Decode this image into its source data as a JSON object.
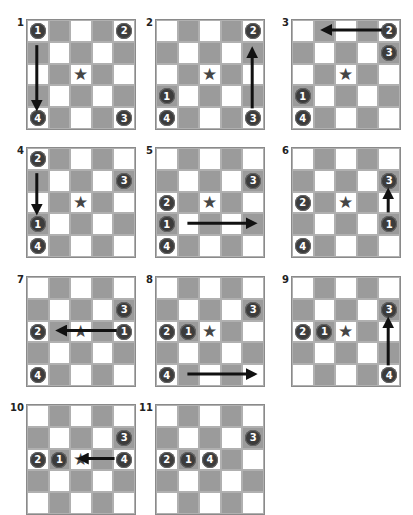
{
  "colors": {
    "gray_cell": "#9b9b9b",
    "white_cell": "#ffffff",
    "piece": "#3c3c3c",
    "star": "#454545",
    "arrow": "#111111"
  },
  "grid_size": 5,
  "boards": [
    {
      "label": "1",
      "x": 26,
      "y": 19,
      "star": [
        2,
        2
      ],
      "pieces": [
        {
          "n": "1",
          "r": 0,
          "c": 0
        },
        {
          "n": "2",
          "r": 0,
          "c": 4
        },
        {
          "n": "3",
          "r": 4,
          "c": 4
        },
        {
          "n": "4",
          "r": 4,
          "c": 0
        }
      ],
      "arrow": {
        "from": [
          0.7,
          0
        ],
        "to": [
          3.5,
          0
        ]
      }
    },
    {
      "label": "2",
      "x": 155,
      "y": 19,
      "star": [
        2,
        2
      ],
      "pieces": [
        {
          "n": "2",
          "r": 0,
          "c": 4
        },
        {
          "n": "1",
          "r": 3,
          "c": 0
        },
        {
          "n": "4",
          "r": 4,
          "c": 0
        },
        {
          "n": "3",
          "r": 4,
          "c": 4
        }
      ],
      "arrow": {
        "from": [
          3.6,
          4
        ],
        "to": [
          1.0,
          4
        ]
      }
    },
    {
      "label": "3",
      "x": 291,
      "y": 19,
      "star": [
        2,
        2
      ],
      "pieces": [
        {
          "n": "2",
          "r": 0,
          "c": 4
        },
        {
          "n": "3",
          "r": 1,
          "c": 4
        },
        {
          "n": "1",
          "r": 3,
          "c": 0
        },
        {
          "n": "4",
          "r": 4,
          "c": 0
        }
      ],
      "arrow": {
        "from": [
          0,
          3.7
        ],
        "to": [
          0,
          1.1
        ]
      }
    },
    {
      "label": "4",
      "x": 26,
      "y": 147,
      "star": [
        2,
        2
      ],
      "pieces": [
        {
          "n": "2",
          "r": 0,
          "c": 0
        },
        {
          "n": "3",
          "r": 1,
          "c": 4
        },
        {
          "n": "1",
          "r": 3,
          "c": 0
        },
        {
          "n": "4",
          "r": 4,
          "c": 0
        }
      ],
      "arrow": {
        "from": [
          0.7,
          0
        ],
        "to": [
          2.4,
          0
        ]
      }
    },
    {
      "label": "5",
      "x": 155,
      "y": 147,
      "star": [
        2,
        2
      ],
      "pieces": [
        {
          "n": "3",
          "r": 1,
          "c": 4
        },
        {
          "n": "2",
          "r": 2,
          "c": 0
        },
        {
          "n": "1",
          "r": 3,
          "c": 0
        },
        {
          "n": "4",
          "r": 4,
          "c": 0
        }
      ],
      "arrow": {
        "from": [
          3,
          1.0
        ],
        "to": [
          3,
          4.0
        ]
      }
    },
    {
      "label": "6",
      "x": 291,
      "y": 147,
      "star": [
        2,
        2
      ],
      "pieces": [
        {
          "n": "3",
          "r": 1,
          "c": 4
        },
        {
          "n": "2",
          "r": 2,
          "c": 0
        },
        {
          "n": "1",
          "r": 3,
          "c": 4
        },
        {
          "n": "4",
          "r": 4,
          "c": 0
        }
      ],
      "arrow": {
        "from": [
          2.5,
          4
        ],
        "to": [
          1.6,
          4
        ]
      }
    },
    {
      "label": "7",
      "x": 26,
      "y": 276,
      "star": [
        2,
        2
      ],
      "pieces": [
        {
          "n": "3",
          "r": 1,
          "c": 4
        },
        {
          "n": "2",
          "r": 2,
          "c": 0
        },
        {
          "n": "1",
          "r": 2,
          "c": 4
        },
        {
          "n": "4",
          "r": 4,
          "c": 0
        }
      ],
      "arrow": {
        "from": [
          2,
          3.7
        ],
        "to": [
          2,
          1.1
        ]
      }
    },
    {
      "label": "8",
      "x": 155,
      "y": 276,
      "star": [
        2,
        2
      ],
      "pieces": [
        {
          "n": "3",
          "r": 1,
          "c": 4
        },
        {
          "n": "2",
          "r": 2,
          "c": 0
        },
        {
          "n": "1",
          "r": 2,
          "c": 1
        },
        {
          "n": "4",
          "r": 4,
          "c": 0
        }
      ],
      "arrow": {
        "from": [
          4,
          1.0
        ],
        "to": [
          4,
          4.0
        ]
      }
    },
    {
      "label": "9",
      "x": 291,
      "y": 276,
      "star": [
        2,
        2
      ],
      "pieces": [
        {
          "n": "3",
          "r": 1,
          "c": 4
        },
        {
          "n": "2",
          "r": 2,
          "c": 0
        },
        {
          "n": "1",
          "r": 2,
          "c": 1
        },
        {
          "n": "4",
          "r": 4,
          "c": 4
        }
      ],
      "arrow": {
        "from": [
          3.6,
          4
        ],
        "to": [
          1.6,
          4
        ]
      }
    },
    {
      "label": "10",
      "x": 26,
      "y": 404,
      "star": [
        2,
        2
      ],
      "pieces": [
        {
          "n": "3",
          "r": 1,
          "c": 4
        },
        {
          "n": "2",
          "r": 2,
          "c": 0
        },
        {
          "n": "1",
          "r": 2,
          "c": 1
        },
        {
          "n": "4",
          "r": 2,
          "c": 4
        }
      ],
      "arrow": {
        "from": [
          2,
          3.6
        ],
        "to": [
          2,
          2.1
        ]
      }
    },
    {
      "label": "11",
      "x": 155,
      "y": 404,
      "star": null,
      "pieces": [
        {
          "n": "3",
          "r": 1,
          "c": 4
        },
        {
          "n": "2",
          "r": 2,
          "c": 0
        },
        {
          "n": "1",
          "r": 2,
          "c": 1
        },
        {
          "n": "4",
          "r": 2,
          "c": 2
        }
      ],
      "arrow": null
    }
  ]
}
